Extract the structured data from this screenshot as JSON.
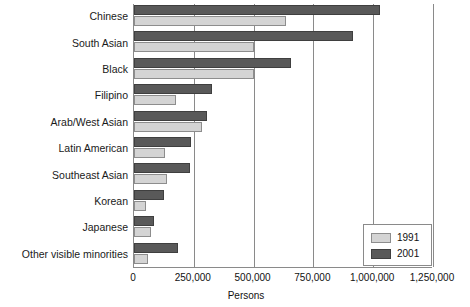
{
  "chart_data": {
    "type": "bar",
    "orientation": "horizontal",
    "title": "",
    "xlabel": "Persons",
    "ylabel": "",
    "xlim": [
      0,
      1250000
    ],
    "xticks": [
      0,
      250000,
      500000,
      750000,
      1000000,
      1250000
    ],
    "xtick_labels": [
      "0",
      "250,000",
      "500,000",
      "750,000",
      "1,000,000",
      "1,250,000"
    ],
    "grid": true,
    "grid_axis": "x",
    "legend_position": "bottom-right",
    "categories": [
      "Chinese",
      "South Asian",
      "Black",
      "Filipino",
      "Arab/West Asian",
      "Latin American",
      "Southeast Asian",
      "Korean",
      "Japanese",
      "Other visible minorities"
    ],
    "series": [
      {
        "name": "1991",
        "color": "#d4d4d4",
        "values": [
          635000,
          500000,
          500000,
          175000,
          285000,
          130000,
          140000,
          50000,
          70000,
          60000
        ]
      },
      {
        "name": "2001",
        "color": "#595959",
        "values": [
          1030000,
          915000,
          655000,
          325000,
          305000,
          240000,
          235000,
          125000,
          85000,
          185000
        ]
      }
    ]
  },
  "legend": {
    "items": [
      {
        "label": "1991",
        "color": "#d4d4d4"
      },
      {
        "label": "2001",
        "color": "#595959"
      }
    ]
  },
  "axis": {
    "x_title": "Persons"
  }
}
